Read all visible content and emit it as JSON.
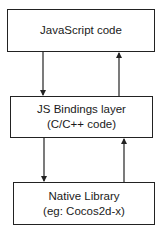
{
  "diagram": {
    "boxes": [
      {
        "lines": [
          "JavaScript code"
        ]
      },
      {
        "lines": [
          "JS Bindings layer",
          "(C/C++ code)"
        ]
      },
      {
        "lines": [
          "Native Library",
          "(eg: Cocos2d-x)"
        ]
      }
    ],
    "arrows": [
      {
        "from": "JavaScript code",
        "to": "JS Bindings layer",
        "direction": "down"
      },
      {
        "from": "JS Bindings layer",
        "to": "JavaScript code",
        "direction": "up"
      },
      {
        "from": "JS Bindings layer",
        "to": "Native Library",
        "direction": "down"
      },
      {
        "from": "Native Library",
        "to": "JS Bindings layer",
        "direction": "up"
      }
    ]
  }
}
